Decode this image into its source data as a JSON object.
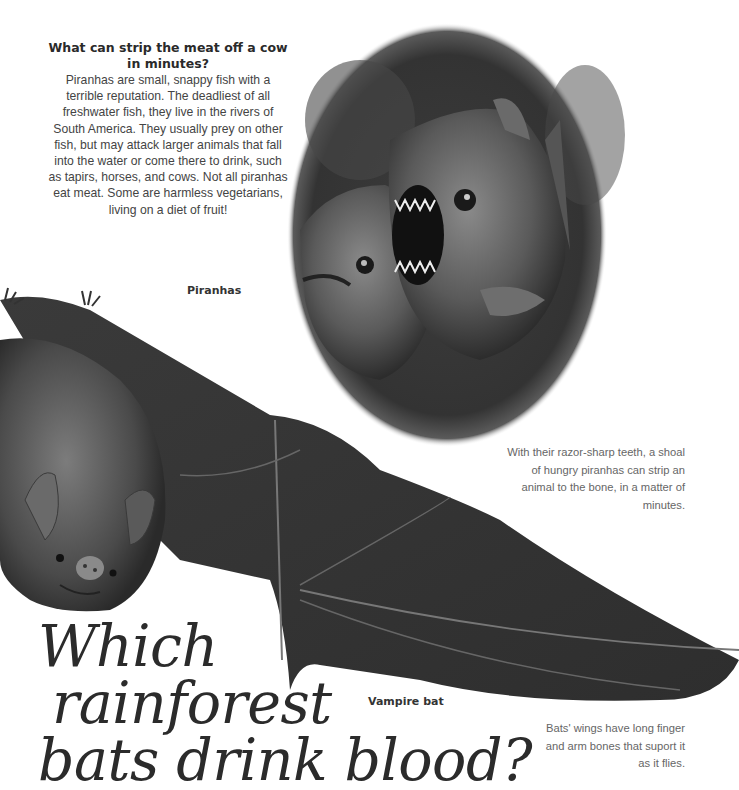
{
  "piranha_section": {
    "heading": "What can strip the meat off a cow in minutes?",
    "body": "Piranhas are small, snappy fish with a terrible reputation. The deadliest of all freshwater fish, they live in the rivers of South America. They usually prey on other fish, but may attack larger animals that fall into the water or come there to drink, such as tapirs, horses, and cows. Not all piranhas eat meat. Some are harmless vegetarians, living on a diet of fruit!",
    "image_label": "Piranhas",
    "caption": "With their razor-sharp teeth, a shoal of hungry piranhas can strip an animal to the bone, in a matter of minutes."
  },
  "bat_section": {
    "title_lines": [
      "Which",
      "rainforest",
      "bats drink blood?"
    ],
    "image_label": "Vampire bat",
    "caption": "Bats' wings have long finger and arm bones that suport it as it flies."
  },
  "images": {
    "piranha_circle": "piranhas-illustration",
    "bat": "vampire-bat-illustration"
  },
  "colors": {
    "background": "#ffffff",
    "text_dark": "#2a2a2a",
    "text_mid": "#444444",
    "caption": "#666666"
  }
}
